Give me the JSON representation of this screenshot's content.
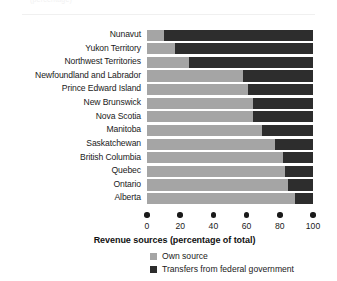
{
  "figure": {
    "clipped_caption": "(percentage)",
    "axis_title": "Revenue sources (percentage of total)"
  },
  "legend": {
    "items": [
      {
        "label": "Own source",
        "key": "own",
        "color": "#a5a5a5"
      },
      {
        "label": "Transfers from federal government",
        "key": "transfer",
        "color": "#2d2d2d"
      }
    ]
  },
  "axis": {
    "ticks": [
      0,
      20,
      40,
      60,
      80,
      100
    ],
    "tick_labels": [
      "0",
      "20",
      "40",
      "60",
      "80",
      "100"
    ],
    "min": 0,
    "max": 100
  },
  "chart_data": {
    "type": "bar",
    "orientation": "horizontal",
    "stacked": true,
    "title": "",
    "subtitle": "",
    "xlabel": "Revenue sources (percentage of total)",
    "ylabel": "",
    "xlim": [
      0,
      100
    ],
    "xticks": [
      0,
      20,
      40,
      60,
      80,
      100
    ],
    "grid": false,
    "legend_position": "bottom-left",
    "categories": [
      "Nunavut",
      "Yukon Territory",
      "Northwest Territories",
      "Newfoundland and Labrador",
      "Prince Edward Island",
      "New Brunswick",
      "Nova Scotia",
      "Manitoba",
      "Saskatchewan",
      "British Columbia",
      "Quebec",
      "Ontario",
      "Alberta"
    ],
    "series": [
      {
        "name": "Own source",
        "color": "#a5a5a5",
        "values": [
          10,
          17,
          25,
          58,
          61,
          64,
          64,
          69,
          77,
          82,
          83,
          85,
          89
        ]
      },
      {
        "name": "Transfers from federal government",
        "color": "#2d2d2d",
        "values": [
          90,
          83,
          75,
          42,
          39,
          36,
          36,
          31,
          23,
          18,
          17,
          15,
          11
        ]
      }
    ]
  }
}
